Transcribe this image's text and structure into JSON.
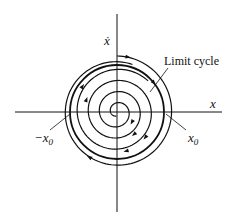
{
  "diagram": {
    "type": "phase-portrait",
    "axes": {
      "x_label": "x",
      "y_label": "ẋ"
    },
    "annotations": {
      "limit_cycle": "Limit cycle",
      "neg_x0": "−x",
      "neg_x0_sub": "0",
      "pos_x0": "x",
      "pos_x0_sub": "0"
    },
    "colors": {
      "ink": "#111111",
      "background": "#ffffff"
    },
    "trajectories": [
      {
        "name": "inner-spiral",
        "direction": "clockwise",
        "behavior": "spirals outward toward limit cycle"
      },
      {
        "name": "limit-cycle",
        "direction": "clockwise",
        "behavior": "closed orbit"
      },
      {
        "name": "outer-spiral",
        "direction": "clockwise",
        "behavior": "spirals inward toward limit cycle"
      }
    ]
  }
}
